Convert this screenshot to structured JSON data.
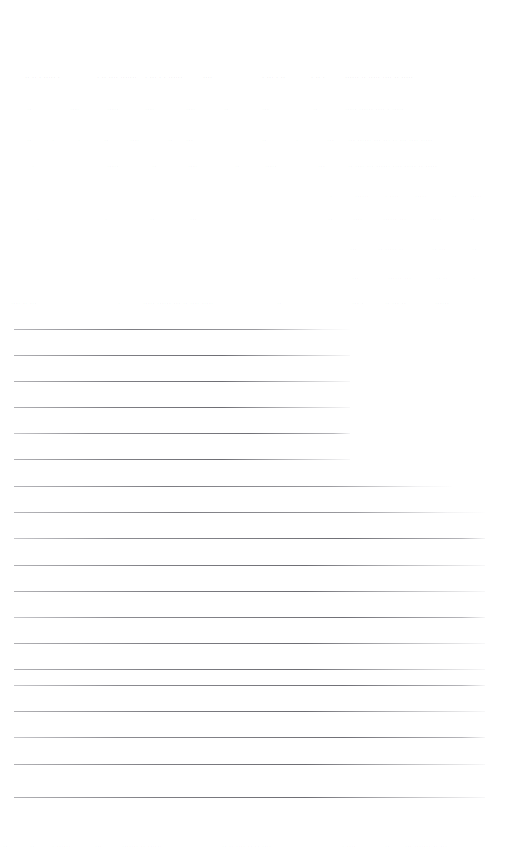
{
  "document": {
    "kind": "scanned-ruled-form",
    "page_width": 519,
    "page_height": 857,
    "background_color": "#ffffff",
    "rule_color": "#9b9b9f",
    "faint_text_color": "#7878806b"
  },
  "faint_text_rows": [
    {
      "id": "row-1",
      "top": 71,
      "emphasis": "strong",
      "segments": [
        {
          "left": 25,
          "text": "..  .. .  ..... ."
        },
        {
          "left": 97,
          "text": ". .. ....  ......."
        },
        {
          "left": 145,
          "text": ". ... . . ......"
        },
        {
          "left": 203,
          "text": "...."
        },
        {
          "left": 262,
          "text": ". ... . .."
        },
        {
          "left": 311,
          "text": ". ..  ."
        },
        {
          "left": 345,
          "text": "......  .. ..... .... ..  ....."
        }
      ]
    },
    {
      "id": "row-2",
      "top": 103,
      "emphasis": "normal",
      "segments": [
        {
          "left": 27,
          "text": ".."
        },
        {
          "left": 70,
          "text": "...."
        },
        {
          "left": 107,
          "text": "....."
        },
        {
          "left": 145,
          "text": "...."
        },
        {
          "left": 186,
          "text": "...."
        },
        {
          "left": 224,
          "text": ".."
        },
        {
          "left": 262,
          "text": "..."
        },
        {
          "left": 313,
          "text": ".."
        },
        {
          "left": 345,
          "text": "..... ......  .... . ....."
        }
      ]
    },
    {
      "id": "row-3",
      "top": 134,
      "emphasis": "normal",
      "segments": [
        {
          "left": 27,
          "text": ".."
        },
        {
          "left": 52,
          "text": "."
        },
        {
          "left": 78,
          "text": "."
        },
        {
          "left": 104,
          "text": ".."
        },
        {
          "left": 130,
          "text": "...."
        },
        {
          "left": 168,
          "text": ".."
        },
        {
          "left": 186,
          "text": "..."
        },
        {
          "left": 262,
          "text": ".."
        },
        {
          "left": 296,
          "text": "."
        },
        {
          "left": 327,
          "text": "..."
        },
        {
          "left": 348,
          "text": "... ...... ... ... .. ... ....  ....."
        }
      ]
    },
    {
      "id": "row-4",
      "top": 160,
      "emphasis": "normal",
      "segments": [
        {
          "left": 32,
          "text": "."
        },
        {
          "left": 107,
          "text": "....."
        },
        {
          "left": 152,
          "text": ".."
        },
        {
          "left": 188,
          "text": "...."
        },
        {
          "left": 235,
          "text": ".."
        },
        {
          "left": 265,
          "text": "....."
        },
        {
          "left": 318,
          "text": "..."
        },
        {
          "left": 348,
          "text": ".. .... ... ...... .... ..... ..  ....."
        }
      ]
    },
    {
      "id": "row-5",
      "top": 190,
      "emphasis": "faintest",
      "segments": [
        {
          "left": 330,
          "text": "."
        },
        {
          "left": 355,
          "text": "......"
        },
        {
          "left": 385,
          "text": ". ...."
        },
        {
          "left": 415,
          "text": "....."
        },
        {
          "left": 452,
          "text": ".."
        },
        {
          "left": 470,
          "text": "....."
        }
      ]
    },
    {
      "id": "row-6",
      "top": 213,
      "emphasis": "faintest",
      "segments": [
        {
          "left": 37,
          "text": "."
        },
        {
          "left": 105,
          "text": "."
        },
        {
          "left": 150,
          "text": ".."
        },
        {
          "left": 190,
          "text": "..."
        },
        {
          "left": 328,
          "text": ".."
        },
        {
          "left": 353,
          "text": "...."
        },
        {
          "left": 383,
          "text": "...... ..."
        },
        {
          "left": 430,
          "text": "....."
        },
        {
          "left": 470,
          "text": ".."
        }
      ]
    },
    {
      "id": "row-7",
      "top": 243,
      "emphasis": "faintest",
      "segments": [
        {
          "left": 350,
          "text": "..."
        },
        {
          "left": 378,
          "text": ".. ..... .."
        },
        {
          "left": 432,
          "text": ".. ..."
        },
        {
          "left": 472,
          "text": ".."
        }
      ]
    },
    {
      "id": "row-8",
      "top": 272,
      "emphasis": "faintest",
      "segments": [
        {
          "left": 352,
          "text": "..."
        },
        {
          "left": 388,
          "text": "...... ..."
        },
        {
          "left": 436,
          "text": ".. .."
        },
        {
          "left": 473,
          "text": "."
        }
      ]
    },
    {
      "id": "row-9",
      "top": 297,
      "emphasis": "normal",
      "segments": [
        {
          "left": 11,
          "text": ".... .. ..."
        },
        {
          "left": 118,
          "text": "."
        },
        {
          "left": 143,
          "text": "..... ...... ... .. .... ....."
        },
        {
          "left": 277,
          "text": ".."
        },
        {
          "left": 352,
          "text": "... ."
        },
        {
          "left": 385,
          "text": ".. ... .."
        },
        {
          "left": 435,
          "text": "......"
        }
      ]
    },
    {
      "id": "row-10",
      "top": 840,
      "emphasis": "faintest",
      "segments": [
        {
          "left": 3,
          "text": ".."
        },
        {
          "left": 30,
          "text": ".."
        },
        {
          "left": 52,
          "text": ". ......"
        },
        {
          "left": 95,
          "text": "..."
        },
        {
          "left": 122,
          "text": "....... .. ......"
        },
        {
          "left": 222,
          "text": ".. .. .... .. .. ...."
        },
        {
          "left": 342,
          "text": ". ...."
        },
        {
          "left": 385,
          "text": ".."
        },
        {
          "left": 405,
          "text": "... ....... .. ..."
        }
      ]
    }
  ],
  "rules": [
    {
      "id": "rule-1",
      "top": 329,
      "left": 14,
      "width": 336,
      "style": "fadeout"
    },
    {
      "id": "rule-2",
      "top": 355,
      "left": 14,
      "width": 336,
      "style": "soft"
    },
    {
      "id": "rule-3",
      "top": 381,
      "left": 14,
      "width": 336,
      "style": "soft"
    },
    {
      "id": "rule-4",
      "top": 407,
      "left": 14,
      "width": 336,
      "style": "soft"
    },
    {
      "id": "rule-5",
      "top": 433,
      "left": 14,
      "width": 336,
      "style": "soft2"
    },
    {
      "id": "rule-6",
      "top": 459,
      "left": 14,
      "width": 336,
      "style": "soft"
    },
    {
      "id": "rule-7",
      "top": 486,
      "left": 14,
      "width": 438,
      "style": "fadeout"
    },
    {
      "id": "rule-8",
      "top": 512,
      "left": 14,
      "width": 471,
      "style": "fadeout"
    },
    {
      "id": "rule-9",
      "top": 538,
      "left": 14,
      "width": 471,
      "style": "soft2"
    },
    {
      "id": "rule-10",
      "top": 565,
      "left": 14,
      "width": 471,
      "style": "soft"
    },
    {
      "id": "rule-11",
      "top": 591,
      "left": 14,
      "width": 471,
      "style": "soft"
    },
    {
      "id": "rule-12",
      "top": 617,
      "left": 14,
      "width": 471,
      "style": "soft2"
    },
    {
      "id": "rule-13",
      "top": 643,
      "left": 14,
      "width": 471,
      "style": "soft"
    },
    {
      "id": "rule-14",
      "top": 669,
      "left": 14,
      "width": 471,
      "style": "soft"
    },
    {
      "id": "rule-15",
      "top": 685,
      "left": 14,
      "width": 471,
      "style": "soft2"
    },
    {
      "id": "rule-16",
      "top": 711,
      "left": 14,
      "width": 471,
      "style": "soft"
    },
    {
      "id": "rule-17",
      "top": 737,
      "left": 14,
      "width": 471,
      "style": "soft2"
    },
    {
      "id": "rule-18",
      "top": 764,
      "left": 14,
      "width": 471,
      "style": "soft"
    },
    {
      "id": "rule-19",
      "top": 797,
      "left": 14,
      "width": 471,
      "style": "soft"
    }
  ]
}
